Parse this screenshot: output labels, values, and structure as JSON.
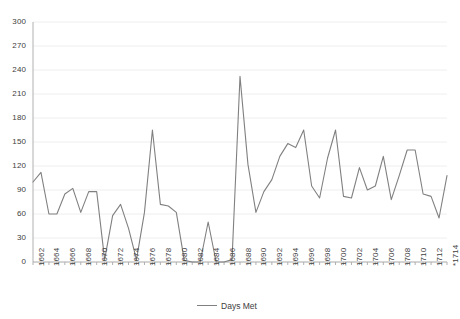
{
  "chart_data": {
    "type": "line",
    "title": "",
    "xlabel": "",
    "ylabel": "",
    "ylim": [
      0,
      300
    ],
    "ytick_step": 30,
    "yticks": [
      0,
      30,
      60,
      90,
      120,
      150,
      180,
      210,
      240,
      270,
      300
    ],
    "grid": true,
    "grid_axis": "y",
    "legend": "bottom",
    "line_color": "#808080",
    "axis_color": "#b0b0b0",
    "grid_color": "#eeeeee",
    "tick_label_color": "#404040",
    "series": [
      {
        "name": "Days Met",
        "values": [
          100,
          112,
          60,
          60,
          85,
          92,
          62,
          88,
          88,
          3,
          58,
          72,
          42,
          3,
          62,
          165,
          72,
          70,
          62,
          2,
          0,
          0,
          50,
          0,
          0,
          3,
          232,
          122,
          62,
          88,
          103,
          132,
          148,
          143,
          165,
          95,
          80,
          130,
          165,
          82,
          80,
          118,
          90,
          95,
          132,
          78,
          108,
          140,
          140,
          85,
          82,
          55,
          108
        ]
      }
    ],
    "x": [
      1662,
      1663,
      1664,
      1665,
      1666,
      1667,
      1668,
      1669,
      1670,
      1671,
      1672,
      1673,
      1674,
      1675,
      1676,
      1677,
      1678,
      1679,
      1680,
      1681,
      1682,
      1683,
      1684,
      1685,
      1686,
      1687,
      1688,
      1689,
      1690,
      1691,
      1692,
      1693,
      1694,
      1695,
      1696,
      1697,
      1698,
      1699,
      1700,
      1701,
      1702,
      1703,
      1704,
      1705,
      1706,
      1707,
      1708,
      1709,
      1710,
      1711,
      1712,
      1713,
      1714
    ],
    "xtick_labels": [
      "1662",
      "",
      "1664",
      "",
      "1666",
      "",
      "1668",
      "",
      "1670",
      "",
      "1672",
      "",
      "1674",
      "",
      "1676",
      "",
      "1678",
      "",
      "1680",
      "",
      "1682",
      "",
      "1684",
      "",
      "1686",
      "",
      "1688",
      "",
      "1690",
      "",
      "1692",
      "",
      "1694",
      "",
      "1696",
      "",
      "1698",
      "",
      "1700",
      "",
      "1702",
      "",
      "1704",
      "",
      "1706",
      "",
      "1708",
      "",
      "1710",
      "",
      "1712",
      "",
      "*1714"
    ]
  },
  "legend": {
    "entries": [
      {
        "label": "Days Met",
        "color": "#808080",
        "marker": "line-marker"
      }
    ]
  }
}
